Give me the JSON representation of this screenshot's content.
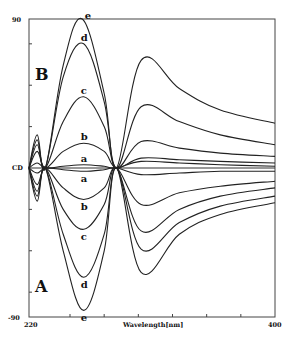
{
  "chart_data": {
    "type": "line",
    "title": "",
    "xlabel": "Wavelength[nm]",
    "ylabel": "CD",
    "xlim": [
      220,
      400
    ],
    "ylim": [
      -90,
      90
    ],
    "x_tick_labels": [
      "220",
      "400"
    ],
    "x_ticks": [
      250,
      275,
      300,
      325,
      350,
      375
    ],
    "y_tick_labels": [
      "90",
      "CD",
      "-90"
    ],
    "y_ticks": [
      -75,
      -50,
      -25,
      25,
      50,
      75
    ],
    "grid": false,
    "legend": "none (curves labeled inline a–e)",
    "panels": [
      {
        "name": "B",
        "description": "positive-sign spectra",
        "series": [
          {
            "name": "a",
            "points": [
              [
                220,
                0
              ],
              [
                226,
                3
              ],
              [
                232,
                0
              ],
              [
                245,
                1
              ],
              [
                260,
                2
              ],
              [
                275,
                1
              ],
              [
                284,
                0
              ],
              [
                302,
                4
              ],
              [
                330,
                3
              ],
              [
                360,
                2
              ],
              [
                400,
                1
              ]
            ]
          },
          {
            "name": "b",
            "points": [
              [
                220,
                0
              ],
              [
                226,
                10
              ],
              [
                232,
                0
              ],
              [
                245,
                10
              ],
              [
                260,
                15
              ],
              [
                275,
                10
              ],
              [
                284,
                0
              ],
              [
                302,
                6
              ],
              [
                330,
                5
              ],
              [
                360,
                4
              ],
              [
                400,
                3
              ]
            ]
          },
          {
            "name": "c",
            "points": [
              [
                220,
                0
              ],
              [
                226,
                14
              ],
              [
                232,
                0
              ],
              [
                245,
                28
              ],
              [
                260,
                43
              ],
              [
                275,
                25
              ],
              [
                284,
                0
              ],
              [
                302,
                16
              ],
              [
                330,
                12
              ],
              [
                360,
                9
              ],
              [
                400,
                7
              ]
            ]
          },
          {
            "name": "d",
            "points": [
              [
                220,
                0
              ],
              [
                226,
                17
              ],
              [
                232,
                0
              ],
              [
                245,
                55
              ],
              [
                260,
                75
              ],
              [
                275,
                40
              ],
              [
                284,
                0
              ],
              [
                302,
                37
              ],
              [
                330,
                28
              ],
              [
                360,
                20
              ],
              [
                400,
                14
              ]
            ]
          },
          {
            "name": "e",
            "points": [
              [
                220,
                0
              ],
              [
                226,
                20
              ],
              [
                232,
                0
              ],
              [
                245,
                62
              ],
              [
                259,
                90
              ],
              [
                275,
                45
              ],
              [
                284,
                0
              ],
              [
                302,
                65
              ],
              [
                330,
                48
              ],
              [
                360,
                35
              ],
              [
                400,
                27
              ]
            ]
          }
        ]
      },
      {
        "name": "A",
        "description": "negative-sign spectra (mirror image)",
        "series": [
          {
            "name": "a",
            "points": [
              [
                220,
                0
              ],
              [
                226,
                -3
              ],
              [
                232,
                0
              ],
              [
                245,
                -1
              ],
              [
                260,
                -2
              ],
              [
                275,
                -1
              ],
              [
                284,
                0
              ],
              [
                302,
                -4
              ],
              [
                330,
                -3
              ],
              [
                360,
                -2
              ],
              [
                400,
                -2
              ]
            ]
          },
          {
            "name": "b",
            "points": [
              [
                220,
                0
              ],
              [
                226,
                -10
              ],
              [
                232,
                0
              ],
              [
                245,
                -12
              ],
              [
                260,
                -19
              ],
              [
                275,
                -12
              ],
              [
                284,
                0
              ],
              [
                302,
                -22
              ],
              [
                330,
                -15
              ],
              [
                360,
                -11
              ],
              [
                400,
                -8
              ]
            ]
          },
          {
            "name": "c",
            "points": [
              [
                220,
                0
              ],
              [
                226,
                -14
              ],
              [
                232,
                0
              ],
              [
                245,
                -25
              ],
              [
                260,
                -37
              ],
              [
                275,
                -22
              ],
              [
                284,
                0
              ],
              [
                302,
                -38
              ],
              [
                330,
                -25
              ],
              [
                360,
                -17
              ],
              [
                400,
                -12
              ]
            ]
          },
          {
            "name": "d",
            "points": [
              [
                220,
                0
              ],
              [
                226,
                -17
              ],
              [
                232,
                0
              ],
              [
                245,
                -40
              ],
              [
                260,
                -66
              ],
              [
                275,
                -40
              ],
              [
                284,
                0
              ],
              [
                302,
                -49
              ],
              [
                330,
                -33
              ],
              [
                360,
                -23
              ],
              [
                400,
                -17
              ]
            ]
          },
          {
            "name": "e",
            "points": [
              [
                220,
                0
              ],
              [
                226,
                -20
              ],
              [
                232,
                0
              ],
              [
                245,
                -50
              ],
              [
                260,
                -86
              ],
              [
                275,
                -50
              ],
              [
                284,
                0
              ],
              [
                302,
                -63
              ],
              [
                330,
                -40
              ],
              [
                360,
                -28
              ],
              [
                400,
                -21
              ]
            ]
          }
        ]
      }
    ],
    "annotations": [
      {
        "text": "B",
        "position": "upper-left panel label"
      },
      {
        "text": "A",
        "position": "lower-left panel label"
      },
      {
        "text": "a",
        "at": [
          260,
          2
        ]
      },
      {
        "text": "b",
        "at": [
          260,
          15
        ]
      },
      {
        "text": "c",
        "at": [
          260,
          43
        ]
      },
      {
        "text": "d",
        "at": [
          260,
          75
        ]
      },
      {
        "text": "e",
        "at": [
          263,
          88
        ]
      },
      {
        "text": "a",
        "at": [
          260,
          -2
        ]
      },
      {
        "text": "b",
        "at": [
          260,
          -19
        ]
      },
      {
        "text": "c",
        "at": [
          260,
          -37
        ]
      },
      {
        "text": "d",
        "at": [
          260,
          -66
        ]
      },
      {
        "text": "e",
        "at": [
          260,
          -86
        ]
      }
    ],
    "crossover_points_nm": [
      232,
      284
    ]
  },
  "labels": {
    "y_top": "90",
    "y_zero": "CD",
    "y_bottom": "-90",
    "x_left": "220",
    "x_right": "400",
    "x_title": "Wavelength[nm]",
    "panel_B": "B",
    "panel_A": "A"
  },
  "colors": {
    "line": "#222222",
    "axis": "#444444",
    "background": "#ffffff"
  }
}
